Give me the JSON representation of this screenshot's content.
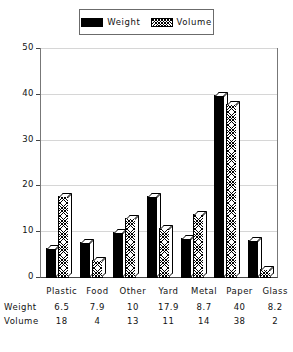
{
  "chart_data": {
    "type": "bar",
    "title": "",
    "xlabel": "",
    "ylabel": "",
    "ylim": [
      0,
      50
    ],
    "yticks": [
      0,
      10,
      20,
      30,
      40,
      50
    ],
    "grid": true,
    "legend_position": "top-center",
    "categories": [
      "Plastic",
      "Food",
      "Other",
      "Yard",
      "Metal",
      "Paper",
      "Glass"
    ],
    "series": [
      {
        "name": "Weight",
        "values": [
          6.5,
          7.9,
          10,
          17.9,
          8.7,
          40,
          8.2
        ],
        "fill": "solid-black"
      },
      {
        "name": "Volume",
        "values": [
          18,
          4,
          13,
          11,
          14,
          38,
          2
        ],
        "fill": "diagonal-hatch"
      }
    ]
  },
  "legend": {
    "items": [
      {
        "label": "Weight",
        "swatch": "solid-black-swatch"
      },
      {
        "label": "Volume",
        "swatch": "hatched-swatch"
      }
    ]
  },
  "axis": {
    "y_ticks": [
      "50",
      "40",
      "30",
      "20",
      "10",
      "0"
    ]
  },
  "table": {
    "row_headers": [
      "Weight",
      "Volume"
    ],
    "columns": [
      "Plastic",
      "Food",
      "Other",
      "Yard",
      "Metal",
      "Paper",
      "Glass"
    ],
    "rows": [
      [
        "6.5",
        "7.9",
        "10",
        "17.9",
        "8.7",
        "40",
        "8.2"
      ],
      [
        "18",
        "4",
        "13",
        "11",
        "14",
        "38",
        "2"
      ]
    ]
  },
  "colors": {
    "weight_fill": "#000000",
    "volume_fill": "#ffffff",
    "grid": "#d6d6d6",
    "frame": "#777777",
    "text": "#111111"
  }
}
